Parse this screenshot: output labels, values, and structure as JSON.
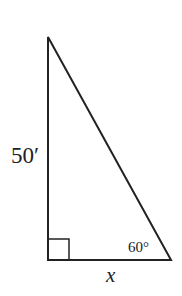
{
  "figure": {
    "type": "right-triangle",
    "vertical_side_label": "50′",
    "angle_label": "60°",
    "base_label": "x",
    "right_angle_marker": true,
    "stroke_color": "#222222",
    "background": "#ffffff"
  }
}
